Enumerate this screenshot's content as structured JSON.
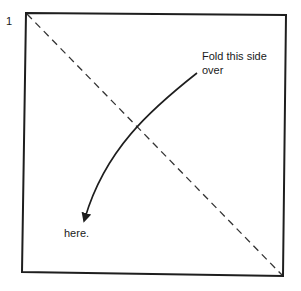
{
  "diagram": {
    "step_number": "1",
    "fold_instruction_line1": "Fold this side",
    "fold_instruction_line2": "over",
    "target_label": "here.",
    "colors": {
      "stroke": "#1e1e1e",
      "dash": "#333333",
      "background": "#ffffff"
    }
  }
}
